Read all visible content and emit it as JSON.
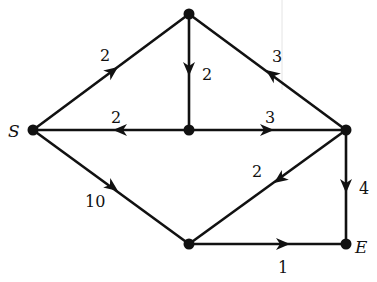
{
  "diagram": {
    "type": "directed-weighted-graph",
    "nodes": [
      {
        "id": "S",
        "label": "S",
        "x": 33,
        "y": 130
      },
      {
        "id": "T",
        "label": "",
        "x": 189,
        "y": 14
      },
      {
        "id": "C",
        "label": "",
        "x": 189,
        "y": 130
      },
      {
        "id": "R",
        "label": "",
        "x": 346,
        "y": 130
      },
      {
        "id": "B",
        "label": "",
        "x": 189,
        "y": 244
      },
      {
        "id": "E",
        "label": "E",
        "x": 346,
        "y": 244
      }
    ],
    "edges": [
      {
        "from": "S",
        "to": "T",
        "weight": "2"
      },
      {
        "from": "T",
        "to": "C",
        "weight": "2"
      },
      {
        "from": "R",
        "to": "T",
        "weight": "3"
      },
      {
        "from": "C",
        "to": "S",
        "weight": "2"
      },
      {
        "from": "C",
        "to": "R",
        "weight": "3"
      },
      {
        "from": "S",
        "to": "B",
        "weight": "10"
      },
      {
        "from": "R",
        "to": "B",
        "weight": "2"
      },
      {
        "from": "R",
        "to": "E",
        "weight": "4"
      },
      {
        "from": "B",
        "to": "E",
        "weight": "1"
      }
    ]
  },
  "labels": {
    "S": "S",
    "E": "E",
    "w_ST": "2",
    "w_TC": "2",
    "w_RT": "3",
    "w_CS": "2",
    "w_CR": "3",
    "w_SB": "10",
    "w_RB": "2",
    "w_RE": "4",
    "w_BE": "1"
  }
}
